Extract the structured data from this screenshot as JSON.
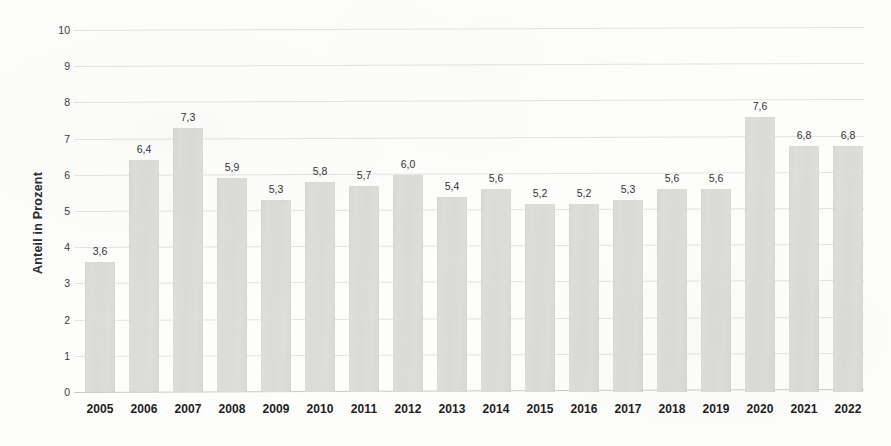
{
  "chart_data": {
    "type": "bar",
    "title": "",
    "subtitle": "",
    "xlabel": "",
    "ylabel": "Anteil in Prozent",
    "ylim": [
      0,
      10
    ],
    "y_ticks": [
      "0",
      "1",
      "2",
      "3",
      "4",
      "5",
      "6",
      "7",
      "8",
      "9",
      "10"
    ],
    "grid": true,
    "legend": "none",
    "decimal_separator": ",",
    "categories": [
      "2005",
      "2006",
      "2007",
      "2008",
      "2009",
      "2010",
      "2011",
      "2012",
      "2013",
      "2014",
      "2015",
      "2016",
      "2017",
      "2018",
      "2019",
      "2020",
      "2021",
      "2022"
    ],
    "values": [
      3.6,
      6.4,
      7.3,
      5.9,
      5.3,
      5.8,
      5.7,
      6.0,
      5.4,
      5.6,
      5.2,
      5.2,
      5.3,
      5.6,
      5.6,
      7.6,
      6.8,
      6.8
    ],
    "value_labels": [
      "3,6",
      "6,4",
      "7,3",
      "5,9",
      "5,3",
      "5,8",
      "5,7",
      "6,0",
      "5,4",
      "5,6",
      "5,2",
      "5,2",
      "5,3",
      "5,6",
      "5,6",
      "7,6",
      "6,8",
      "6,8"
    ],
    "bar_color": "#dededd",
    "gridline_color": "#e2e2e2",
    "axis_color": "#c9c9c9",
    "text_color": "#1d1d1d"
  },
  "axis": {
    "y_title": "Anteil in Prozent"
  }
}
